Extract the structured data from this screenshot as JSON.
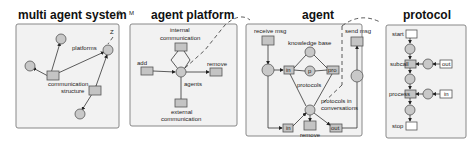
{
  "panels": [
    {
      "title": "multi agent system",
      "labels": [
        "platforms",
        "communication",
        "structure",
        "p1",
        "p2",
        "p3",
        "p4"
      ]
    },
    {
      "title": "agent platform",
      "labels": [
        "internal",
        "communication",
        "add",
        "remove",
        "agents",
        "external",
        "communication"
      ]
    },
    {
      "title": "agent",
      "labels": [
        "receive msg",
        "send msg",
        "knowledge base",
        "kb",
        "in",
        "p",
        "pro",
        "protocols",
        "protocols in",
        "conversations",
        "in",
        "remove",
        "out"
      ]
    },
    {
      "title": "protocol",
      "labels": [
        "start",
        "subcall",
        "out",
        "process",
        "in",
        "stop"
      ]
    }
  ],
  "annotations": {
    "z": "Z",
    "o": "O",
    "m": "M"
  },
  "colors": {
    "panel_bg": "#f2f2f2",
    "node_fill": "#c8c8c8",
    "border": "#888888"
  }
}
